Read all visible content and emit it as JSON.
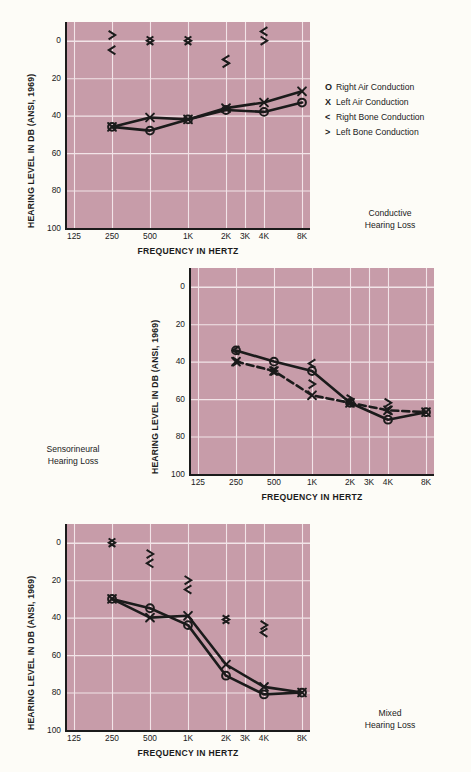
{
  "figure": {
    "background_color": "#fdfcf7",
    "plot_fill_color": "#c79ca9",
    "grid_color": "#f2e4e8",
    "ink_color": "#1b1b1b"
  },
  "legend": {
    "title": "",
    "items": [
      {
        "symbol": "O",
        "symbol_name": "circle-right-air",
        "label": "Right Air Conduction"
      },
      {
        "symbol": "X",
        "symbol_name": "cross-left-air",
        "label": "Left Air Conduction"
      },
      {
        "symbol": "<",
        "symbol_name": "left-angle-right-bone",
        "label": "Right Bone Conduction"
      },
      {
        "symbol": ">",
        "symbol_name": "right-angle-left-bone",
        "label": "Left Bone Conduction"
      }
    ]
  },
  "axes": {
    "ylabel": "HEARING LEVEL IN DB (ANSI, 1969)",
    "xlabel": "FREQUENCY IN HERTZ",
    "yticks": [
      "0",
      "20",
      "40",
      "60",
      "80",
      "100"
    ],
    "yvalues": [
      0,
      20,
      40,
      60,
      80,
      100
    ],
    "ylim": [
      -10,
      100
    ],
    "xticks": [
      "125",
      "250",
      "500",
      "1K",
      "2K",
      "3K",
      "4K",
      "8K"
    ],
    "xvalues": [
      125,
      250,
      500,
      1000,
      2000,
      3000,
      4000,
      8000
    ],
    "grid": true
  },
  "chart_data": [
    {
      "id": "conductive",
      "type": "line",
      "title": "Conductive Hearing Loss",
      "caption_line1": "Conductive",
      "caption_line2": "Hearing Loss",
      "xlabel": "FREQUENCY IN HERTZ",
      "ylabel": "HEARING LEVEL IN DB (ANSI, 1969)",
      "xticks": [
        "125",
        "250",
        "500",
        "1K",
        "2K",
        "3K",
        "4K",
        "8K"
      ],
      "ylim": [
        -10,
        100
      ],
      "series": [
        {
          "name": "Right Air Conduction",
          "symbol": "O",
          "linestyle": "solid",
          "x": [
            250,
            500,
            1000,
            2000,
            4000,
            8000
          ],
          "values": [
            46,
            48,
            42,
            37,
            38,
            33
          ]
        },
        {
          "name": "Left Air Conduction",
          "symbol": "X",
          "linestyle": "solid",
          "x": [
            250,
            500,
            1000,
            2000,
            4000,
            8000
          ],
          "values": [
            46,
            41,
            42,
            36,
            33,
            27
          ]
        },
        {
          "name": "Right Bone Conduction",
          "symbol": "<",
          "linestyle": "none",
          "x": [
            250,
            500,
            1000,
            2000,
            4000
          ],
          "values": [
            5,
            0,
            0,
            10,
            -5
          ]
        },
        {
          "name": "Left Bone Conduction",
          "symbol": ">",
          "linestyle": "none",
          "x": [
            250,
            500,
            1000,
            2000,
            4000
          ],
          "values": [
            -3,
            0,
            0,
            12,
            0
          ]
        }
      ]
    },
    {
      "id": "sensorineural",
      "type": "line",
      "title": "Sensorineural Hearing Loss",
      "caption_line1": "Sensorineural",
      "caption_line2": "Hearing Loss",
      "xlabel": "FREQUENCY IN HERTZ",
      "ylabel": "HEARING LEVEL IN DB (ANSI, 1969)",
      "xticks": [
        "125",
        "250",
        "500",
        "1K",
        "2K",
        "3K",
        "4K",
        "8K"
      ],
      "ylim": [
        -10,
        100
      ],
      "series": [
        {
          "name": "Right Air Conduction",
          "symbol": "O",
          "linestyle": "solid",
          "x": [
            250,
            500,
            1000,
            2000,
            4000,
            8000
          ],
          "values": [
            34,
            40,
            45,
            62,
            71,
            67
          ]
        },
        {
          "name": "Left Air Conduction",
          "symbol": "X",
          "linestyle": "dashed",
          "x": [
            250,
            500,
            1000,
            2000,
            4000,
            8000
          ],
          "values": [
            40,
            45,
            58,
            62,
            66,
            67
          ]
        },
        {
          "name": "Right Bone Conduction",
          "symbol": "<",
          "linestyle": "none",
          "x": [
            250,
            500,
            1000,
            2000,
            4000
          ],
          "values": [
            34,
            45,
            41,
            62,
            66
          ]
        },
        {
          "name": "Left Bone Conduction",
          "symbol": ">",
          "linestyle": "none",
          "x": [
            250,
            500,
            1000,
            2000,
            4000
          ],
          "values": [
            40,
            45,
            52,
            60,
            62
          ]
        }
      ]
    },
    {
      "id": "mixed",
      "type": "line",
      "title": "Mixed Hearing Loss",
      "caption_line1": "Mixed",
      "caption_line2": "Hearing Loss",
      "xlabel": "FREQUENCY IN HERTZ",
      "ylabel": "HEARING LEVEL IN DB (ANSI, 1969)",
      "xticks": [
        "125",
        "250",
        "500",
        "1K",
        "2K",
        "3K",
        "4K",
        "8K"
      ],
      "ylim": [
        -10,
        100
      ],
      "series": [
        {
          "name": "Right Air Conduction",
          "symbol": "O",
          "linestyle": "solid",
          "x": [
            250,
            500,
            1000,
            2000,
            4000,
            8000
          ],
          "values": [
            30,
            35,
            44,
            71,
            81,
            80
          ]
        },
        {
          "name": "Left Air Conduction",
          "symbol": "X",
          "linestyle": "solid",
          "x": [
            250,
            500,
            1000,
            2000,
            4000,
            8000
          ],
          "values": [
            30,
            40,
            39,
            65,
            77,
            80
          ]
        },
        {
          "name": "Right Bone Conduction",
          "symbol": "<",
          "linestyle": "none",
          "x": [
            250,
            500,
            1000,
            2000,
            4000
          ],
          "values": [
            0,
            11,
            25,
            41,
            48
          ]
        },
        {
          "name": "Left Bone Conduction",
          "symbol": ">",
          "linestyle": "none",
          "x": [
            250,
            500,
            1000,
            2000,
            4000
          ],
          "values": [
            0,
            6,
            20,
            41,
            44
          ]
        }
      ]
    }
  ]
}
